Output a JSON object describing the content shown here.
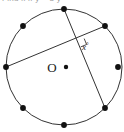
{
  "figure": {
    "caption_partial": "Find x if y = 3 y",
    "center_label": "O",
    "angle_label": "x",
    "angle_degree_symbol": "°",
    "stroke_color": "#333333",
    "point_color": "#111111",
    "background_color": "#ffffff",
    "circle": {
      "center_x": 64,
      "center_y": 67,
      "radius": 58,
      "stroke_width": 1
    },
    "center_dot": {
      "x": 66,
      "y": 67,
      "r": 2.2
    },
    "center_label_pos": {
      "x": 52,
      "y": 71
    },
    "points": [
      {
        "name": "point-top",
        "x": 64,
        "y": 9,
        "r": 2.9
      },
      {
        "name": "point-upper-right",
        "x": 105,
        "y": 26,
        "r": 2.9
      },
      {
        "name": "point-right",
        "x": 118,
        "y": 67,
        "r": 2.9
      },
      {
        "name": "point-lower-right",
        "x": 105,
        "y": 108,
        "r": 2.9
      },
      {
        "name": "point-bottom",
        "x": 64,
        "y": 125,
        "r": 2.9
      },
      {
        "name": "point-lower-left",
        "x": 23,
        "y": 108,
        "r": 2.9
      },
      {
        "name": "point-left",
        "x": 6,
        "y": 67,
        "r": 2.9
      },
      {
        "name": "point-upper-left",
        "x": 23,
        "y": 26,
        "r": 2.9
      }
    ],
    "chords": [
      {
        "name": "chord-top-to-lower-right",
        "x1": 64,
        "y1": 9,
        "x2": 105,
        "y2": 108
      },
      {
        "name": "chord-left-to-upper-right",
        "x1": 6,
        "y1": 67,
        "x2": 105,
        "y2": 26
      }
    ],
    "intersection": {
      "x": 78,
      "y": 42
    },
    "right_angle_mark": {
      "points": "84.2,38.6 86.6,44.5 80.7,46.9"
    },
    "angle_label_pos": {
      "x": 85,
      "y": 50
    }
  }
}
